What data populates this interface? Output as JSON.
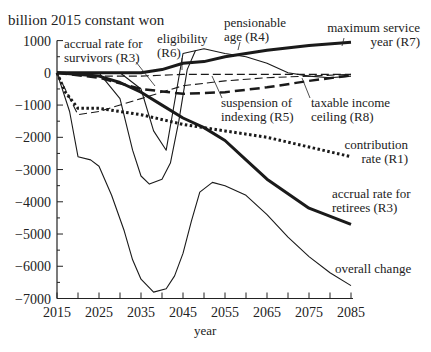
{
  "chart_data": {
    "type": "line",
    "title": "",
    "ylabel": "billion 2015 constant won",
    "xlabel": "year",
    "xlim": [
      2015,
      2085
    ],
    "ylim": [
      -7000,
      1000
    ],
    "x_ticks": [
      2015,
      2025,
      2035,
      2045,
      2055,
      2065,
      2075,
      2085
    ],
    "y_ticks": [
      1000,
      0,
      -1000,
      -2000,
      -3000,
      -4000,
      -5000,
      -6000,
      -7000
    ],
    "y_tick_labels": [
      "1000",
      "0",
      "−1000",
      "−2000",
      "−3000",
      "−4000",
      "−5000",
      "−6000",
      "−7000"
    ],
    "grid": false,
    "legend": "inline labels",
    "series": [
      {
        "name": "maximum service year (R7)",
        "style": "thick-solid",
        "x": [
          2015,
          2025,
          2035,
          2040,
          2045,
          2050,
          2055,
          2065,
          2075,
          2085
        ],
        "values": [
          0,
          0,
          0,
          100,
          300,
          350,
          500,
          700,
          850,
          950
        ]
      },
      {
        "name": "pensionable age (R4)",
        "style": "thin-solid",
        "x": [
          2015,
          2030,
          2035,
          2038,
          2041,
          2045,
          2050,
          2055,
          2060,
          2065,
          2070,
          2075,
          2080,
          2085
        ],
        "values": [
          0,
          0,
          -500,
          -1800,
          -2400,
          600,
          750,
          600,
          500,
          300,
          0,
          -100,
          -150,
          -100
        ]
      },
      {
        "name": "eligibility (R6)",
        "style": "thin-solid",
        "x": [
          2015,
          2025,
          2030,
          2033,
          2035,
          2037,
          2040,
          2042,
          2044,
          2046,
          2048
        ],
        "values": [
          0,
          0,
          -800,
          -2400,
          -3200,
          -3450,
          -3300,
          -2800,
          -1500,
          100,
          700
        ]
      },
      {
        "name": "accrual rate for survivors (R3)",
        "style": "thin-dashed",
        "x": [
          2015,
          2025,
          2035,
          2045,
          2055,
          2065,
          2075,
          2085
        ],
        "values": [
          0,
          -100,
          -100,
          -50,
          -50,
          -50,
          -50,
          -50
        ]
      },
      {
        "name": "suspension of indexing (R5)",
        "style": "thin-dashed",
        "x": [
          2015,
          2020,
          2025,
          2035,
          2045,
          2055,
          2065,
          2075,
          2085
        ],
        "values": [
          0,
          -1300,
          -1200,
          -800,
          -400,
          -250,
          -150,
          -100,
          -50
        ]
      },
      {
        "name": "taxable income ceiling (R8)",
        "style": "thick-dashed",
        "x": [
          2015,
          2025,
          2035,
          2045,
          2055,
          2065,
          2075,
          2085
        ],
        "values": [
          0,
          -150,
          -500,
          -650,
          -600,
          -450,
          -250,
          -80
        ]
      },
      {
        "name": "contribution rate (R1)",
        "style": "dotted",
        "x": [
          2015,
          2017,
          2020,
          2025,
          2035,
          2045,
          2055,
          2065,
          2075,
          2085
        ],
        "values": [
          0,
          -600,
          -1100,
          -1100,
          -1300,
          -1600,
          -1800,
          -2000,
          -2300,
          -2600
        ]
      },
      {
        "name": "accrual rate for retirees (R3)",
        "style": "thick-solid",
        "x": [
          2015,
          2025,
          2030,
          2035,
          2040,
          2045,
          2050,
          2055,
          2060,
          2065,
          2075,
          2085
        ],
        "values": [
          0,
          -100,
          -300,
          -600,
          -1000,
          -1400,
          -1700,
          -2100,
          -2700,
          -3300,
          -4200,
          -4700
        ]
      },
      {
        "name": "overall change",
        "style": "thin-solid",
        "x": [
          2015,
          2018,
          2020,
          2023,
          2025,
          2028,
          2031,
          2033,
          2035,
          2038,
          2041,
          2043,
          2045,
          2047,
          2049,
          2052,
          2055,
          2060,
          2065,
          2070,
          2075,
          2080,
          2085
        ],
        "values": [
          0,
          -1200,
          -2600,
          -2700,
          -2900,
          -3800,
          -4900,
          -5800,
          -6400,
          -6800,
          -6700,
          -6300,
          -5600,
          -4600,
          -3700,
          -3400,
          -3500,
          -3800,
          -4400,
          -5100,
          -5700,
          -6200,
          -6600
        ]
      }
    ],
    "annotations": [
      {
        "text": "accrual rate for",
        "text2": "survivors (R3)"
      },
      {
        "text": "eligibility",
        "text2": "(R6)"
      },
      {
        "text": "pensionable",
        "text2": "age (R4)"
      },
      {
        "text": "maximum service",
        "text2": "year (R7)"
      },
      {
        "text": "suspension of",
        "text2": "indexing (R5)"
      },
      {
        "text": "taxable income",
        "text2": "ceiling (R8)"
      },
      {
        "text": "contribution",
        "text2": "rate (R1)"
      },
      {
        "text": "accrual rate for",
        "text2": "retirees (R3)"
      },
      {
        "text": "overall change",
        "text2": ""
      }
    ]
  }
}
